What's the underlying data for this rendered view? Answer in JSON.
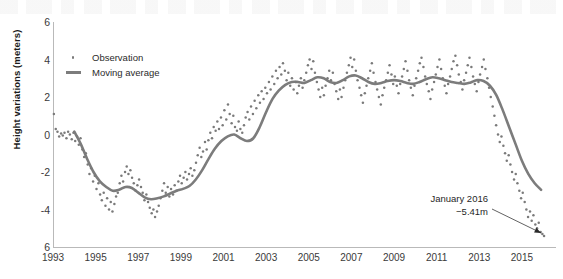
{
  "chart_data": {
    "type": "scatter",
    "title": "",
    "xlabel": "",
    "ylabel": "Height variations (meters)",
    "xlim": [
      1993,
      2016.6
    ],
    "ylim": [
      -6,
      6
    ],
    "grid": false,
    "legend_position": "top-left",
    "y_ticks": [
      "6",
      "4",
      "2",
      "0",
      "-2",
      "-4",
      "6"
    ],
    "y_tick_values": [
      6,
      4,
      2,
      0,
      -2,
      -4,
      -6
    ],
    "x_ticks": [
      "1993",
      "1995",
      "1997",
      "1999",
      "2001",
      "2003",
      "2005",
      "2007",
      "2009",
      "2011",
      "2013",
      "2015"
    ],
    "x_tick_values": [
      1993,
      1995,
      1997,
      1999,
      2001,
      2003,
      2005,
      2007,
      2009,
      2011,
      2013,
      2015
    ],
    "series": [
      {
        "name": "Observation",
        "type": "scatter",
        "color": "#7a7a7a",
        "marker": "dot",
        "x": [
          1993.04,
          1993.13,
          1993.21,
          1993.29,
          1993.38,
          1993.46,
          1993.54,
          1993.63,
          1993.71,
          1993.79,
          1993.88,
          1993.96,
          1994.04,
          1994.13,
          1994.21,
          1994.29,
          1994.38,
          1994.46,
          1994.54,
          1994.63,
          1994.71,
          1994.79,
          1994.88,
          1994.96,
          1995.04,
          1995.13,
          1995.21,
          1995.29,
          1995.38,
          1995.46,
          1995.54,
          1995.63,
          1995.71,
          1995.79,
          1995.88,
          1995.96,
          1996.04,
          1996.13,
          1996.21,
          1996.29,
          1996.38,
          1996.46,
          1996.54,
          1996.63,
          1996.71,
          1996.79,
          1996.88,
          1996.96,
          1997.04,
          1997.13,
          1997.21,
          1997.29,
          1997.38,
          1997.46,
          1997.54,
          1997.63,
          1997.71,
          1997.79,
          1997.88,
          1997.96,
          1998.04,
          1998.13,
          1998.21,
          1998.29,
          1998.38,
          1998.46,
          1998.54,
          1998.63,
          1998.71,
          1998.79,
          1998.88,
          1998.96,
          1999.04,
          1999.13,
          1999.21,
          1999.29,
          1999.38,
          1999.46,
          1999.54,
          1999.63,
          1999.71,
          1999.79,
          1999.88,
          1999.96,
          2000.04,
          2000.13,
          2000.21,
          2000.29,
          2000.38,
          2000.46,
          2000.54,
          2000.63,
          2000.71,
          2000.79,
          2000.88,
          2000.96,
          2001.04,
          2001.13,
          2001.21,
          2001.29,
          2001.38,
          2001.46,
          2001.54,
          2001.63,
          2001.71,
          2001.79,
          2001.88,
          2001.96,
          2002.04,
          2002.13,
          2002.21,
          2002.29,
          2002.38,
          2002.46,
          2002.54,
          2002.63,
          2002.71,
          2002.79,
          2002.88,
          2002.96,
          2003.04,
          2003.13,
          2003.21,
          2003.29,
          2003.38,
          2003.46,
          2003.54,
          2003.63,
          2003.71,
          2003.79,
          2003.88,
          2003.96,
          2004.04,
          2004.13,
          2004.21,
          2004.29,
          2004.38,
          2004.46,
          2004.54,
          2004.63,
          2004.71,
          2004.79,
          2004.88,
          2004.96,
          2005.04,
          2005.13,
          2005.21,
          2005.29,
          2005.38,
          2005.46,
          2005.54,
          2005.63,
          2005.71,
          2005.79,
          2005.88,
          2005.96,
          2006.04,
          2006.13,
          2006.21,
          2006.29,
          2006.38,
          2006.46,
          2006.54,
          2006.63,
          2006.71,
          2006.79,
          2006.88,
          2006.96,
          2007.04,
          2007.13,
          2007.21,
          2007.29,
          2007.38,
          2007.46,
          2007.54,
          2007.63,
          2007.71,
          2007.79,
          2007.88,
          2007.96,
          2008.04,
          2008.13,
          2008.21,
          2008.29,
          2008.38,
          2008.46,
          2008.54,
          2008.63,
          2008.71,
          2008.79,
          2008.88,
          2008.96,
          2009.04,
          2009.13,
          2009.21,
          2009.29,
          2009.38,
          2009.46,
          2009.54,
          2009.63,
          2009.71,
          2009.79,
          2009.88,
          2009.96,
          2010.04,
          2010.13,
          2010.21,
          2010.29,
          2010.38,
          2010.46,
          2010.54,
          2010.63,
          2010.71,
          2010.79,
          2010.88,
          2010.96,
          2011.04,
          2011.13,
          2011.21,
          2011.29,
          2011.38,
          2011.46,
          2011.54,
          2011.63,
          2011.71,
          2011.79,
          2011.88,
          2011.96,
          2012.04,
          2012.13,
          2012.21,
          2012.29,
          2012.38,
          2012.46,
          2012.54,
          2012.63,
          2012.71,
          2012.79,
          2012.88,
          2012.96,
          2013.04,
          2013.13,
          2013.21,
          2013.29,
          2013.38,
          2013.46,
          2013.54,
          2013.63,
          2013.71,
          2013.79,
          2013.88,
          2013.96,
          2014.04,
          2014.13,
          2014.21,
          2014.29,
          2014.38,
          2014.46,
          2014.54,
          2014.63,
          2014.71,
          2014.79,
          2014.88,
          2014.96,
          2015.04,
          2015.13,
          2015.21,
          2015.29,
          2015.38,
          2015.46,
          2015.54,
          2015.63,
          2015.71,
          2015.79,
          2015.88,
          2015.96,
          2016.04
        ],
        "y": [
          1.1,
          0.3,
          0.15,
          -0.1,
          0.05,
          -0.05,
          0.1,
          -0.2,
          0.15,
          0.0,
          -0.25,
          0.1,
          -0.35,
          -0.1,
          -0.55,
          -0.2,
          -0.8,
          -1.2,
          -1.0,
          -1.6,
          -2.1,
          -1.8,
          -2.5,
          -2.2,
          -2.9,
          -2.6,
          -3.2,
          -3.5,
          -3.1,
          -3.8,
          -3.4,
          -4.0,
          -3.6,
          -4.1,
          -3.7,
          -3.3,
          -3.1,
          -2.6,
          -2.2,
          -2.5,
          -2.0,
          -1.7,
          -2.1,
          -1.9,
          -2.3,
          -2.6,
          -3.0,
          -2.7,
          -2.4,
          -2.8,
          -3.1,
          -3.5,
          -3.2,
          -3.6,
          -3.9,
          -4.2,
          -4.0,
          -4.4,
          -4.1,
          -3.8,
          -3.4,
          -3.0,
          -2.6,
          -3.1,
          -2.8,
          -3.3,
          -2.9,
          -3.2,
          -2.7,
          -3.0,
          -2.5,
          -2.2,
          -2.6,
          -2.3,
          -2.0,
          -2.4,
          -2.1,
          -1.8,
          -2.2,
          -1.9,
          -1.5,
          -1.1,
          -0.7,
          -1.2,
          -0.9,
          -0.4,
          -0.8,
          -0.3,
          0.1,
          -0.2,
          0.4,
          0.2,
          0.7,
          0.3,
          0.9,
          0.5,
          1.3,
          0.8,
          1.6,
          1.1,
          0.6,
          1.0,
          0.4,
          0.2,
          0.7,
          0.3,
          0.1,
          0.5,
          0.9,
          1.2,
          0.8,
          1.5,
          1.1,
          1.8,
          1.4,
          2.1,
          1.7,
          2.3,
          1.9,
          2.5,
          2.2,
          2.8,
          2.4,
          3.1,
          2.7,
          3.4,
          3.0,
          3.6,
          3.2,
          3.8,
          3.4,
          2.9,
          3.3,
          2.6,
          3.0,
          2.4,
          2.8,
          2.2,
          2.6,
          3.0,
          2.5,
          2.9,
          3.3,
          3.7,
          4.0,
          3.5,
          3.9,
          3.3,
          2.8,
          2.4,
          2.0,
          2.5,
          2.1,
          2.6,
          3.0,
          3.4,
          2.9,
          3.3,
          2.7,
          2.3,
          1.9,
          2.4,
          2.0,
          2.5,
          2.9,
          3.3,
          3.7,
          4.1,
          3.6,
          4.0,
          3.4,
          2.9,
          2.5,
          2.1,
          1.7,
          2.2,
          2.6,
          3.0,
          3.4,
          3.8,
          3.3,
          2.8,
          2.4,
          2.0,
          1.6,
          2.1,
          2.5,
          2.9,
          3.3,
          3.7,
          3.2,
          2.7,
          3.1,
          2.6,
          2.2,
          2.7,
          3.1,
          3.5,
          3.9,
          3.4,
          2.9,
          2.5,
          2.1,
          2.6,
          3.0,
          3.4,
          3.8,
          4.1,
          3.6,
          3.1,
          2.7,
          2.3,
          1.9,
          2.4,
          2.8,
          3.2,
          3.6,
          4.0,
          3.5,
          3.0,
          2.6,
          2.2,
          2.7,
          3.1,
          3.5,
          3.9,
          4.2,
          3.7,
          3.2,
          2.8,
          2.4,
          2.9,
          3.3,
          3.7,
          4.1,
          3.6,
          3.1,
          2.7,
          2.3,
          2.8,
          3.2,
          3.6,
          4.0,
          3.5,
          3.0,
          2.5,
          2.0,
          1.5,
          1.0,
          0.5,
          0.0,
          -0.4,
          -0.1,
          -0.6,
          -1.0,
          -1.4,
          -1.1,
          -1.6,
          -2.0,
          -2.4,
          -2.1,
          -2.6,
          -3.0,
          -3.4,
          -3.1,
          -3.6,
          -4.0,
          -4.4,
          -4.1,
          -4.6,
          -4.3,
          -4.8,
          -5.0,
          -4.7,
          -5.2,
          -5.3,
          -5.41
        ]
      },
      {
        "name": "Moving average",
        "type": "line",
        "color": "#7c7c7c",
        "x": [
          1994.0,
          1994.3,
          1994.6,
          1994.9,
          1995.2,
          1995.5,
          1995.8,
          1996.1,
          1996.4,
          1996.7,
          1997.0,
          1997.3,
          1997.6,
          1997.9,
          1998.2,
          1998.5,
          1998.8,
          1999.1,
          1999.4,
          1999.7,
          2000.0,
          2000.3,
          2000.6,
          2000.9,
          2001.2,
          2001.5,
          2001.8,
          2002.1,
          2002.4,
          2002.7,
          2003.0,
          2003.3,
          2003.6,
          2003.9,
          2004.2,
          2004.5,
          2004.8,
          2005.1,
          2005.4,
          2005.7,
          2006.0,
          2006.3,
          2006.6,
          2006.9,
          2007.2,
          2007.5,
          2007.8,
          2008.1,
          2008.4,
          2008.7,
          2009.0,
          2009.3,
          2009.6,
          2009.9,
          2010.2,
          2010.5,
          2010.8,
          2011.1,
          2011.4,
          2011.7,
          2012.0,
          2012.3,
          2012.6,
          2012.9,
          2013.2,
          2013.5,
          2013.8,
          2014.1,
          2014.4,
          2014.7,
          2015.0,
          2015.3,
          2015.6,
          2015.9
        ],
        "y": [
          0.15,
          -0.5,
          -1.3,
          -2.0,
          -2.5,
          -2.8,
          -3.0,
          -2.95,
          -2.8,
          -2.85,
          -3.1,
          -3.35,
          -3.45,
          -3.4,
          -3.3,
          -3.15,
          -3.0,
          -2.9,
          -2.75,
          -2.4,
          -1.9,
          -1.3,
          -0.75,
          -0.35,
          -0.1,
          0.0,
          -0.2,
          -0.35,
          -0.2,
          0.4,
          1.2,
          1.9,
          2.35,
          2.65,
          2.8,
          2.8,
          2.75,
          2.9,
          3.05,
          3.0,
          2.8,
          2.75,
          2.9,
          3.1,
          3.15,
          3.0,
          2.8,
          2.7,
          2.75,
          2.85,
          2.9,
          2.85,
          2.75,
          2.7,
          2.8,
          2.95,
          3.05,
          3.0,
          2.9,
          2.8,
          2.75,
          2.7,
          2.78,
          2.9,
          2.85,
          2.6,
          2.1,
          1.3,
          0.4,
          -0.5,
          -1.4,
          -2.1,
          -2.6,
          -2.95
        ]
      }
    ],
    "annotation": {
      "line1": "January 2016",
      "line2": "−5.41m",
      "point_x": 2016.04,
      "point_y": -5.41
    }
  },
  "legend": {
    "items": [
      {
        "label": "Observation",
        "key": "dot"
      },
      {
        "label": "Moving average",
        "key": "line"
      }
    ]
  }
}
